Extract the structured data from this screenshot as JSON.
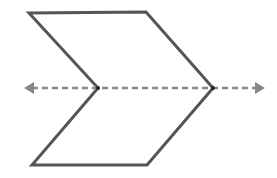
{
  "diagram": {
    "shape": {
      "type": "chevron",
      "stroke_color": "#555555",
      "stroke_width": 3,
      "fill": "#ffffff",
      "points": [
        [
          29,
          13
        ],
        [
          146,
          12
        ],
        [
          213,
          88
        ],
        [
          147,
          165
        ],
        [
          32,
          165
        ],
        [
          98,
          88
        ]
      ]
    },
    "axis_line": {
      "type": "dashed-double-arrow",
      "color": "#888888",
      "stroke_width": 2.5,
      "dash": "6 4",
      "start": [
        24,
        88
      ],
      "end": [
        265,
        88
      ]
    },
    "vertices": {
      "left_inner": [
        98,
        88
      ],
      "right_tip": [
        213,
        88
      ]
    }
  }
}
